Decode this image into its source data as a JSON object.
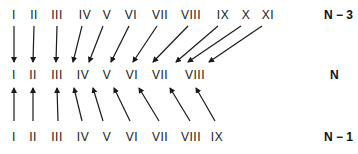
{
  "diagram": {
    "rows": {
      "top": {
        "label": "N − 3",
        "items": [
          "I",
          "II",
          "III",
          "IV",
          "V",
          "VI",
          "VII",
          "VIII",
          "IX",
          "X",
          "XI"
        ],
        "x": [
          14,
          34,
          57,
          85,
          107,
          131,
          160,
          191,
          223,
          246,
          268
        ],
        "y": 19
      },
      "middle": {
        "label": "N",
        "items": [
          "I",
          "II",
          "III",
          "IV",
          "V",
          "VI",
          "VII",
          "VIII"
        ],
        "x": [
          14,
          33,
          57,
          83,
          107,
          132,
          160,
          195
        ],
        "y": 79
      },
      "bottom": {
        "label": "N − 1",
        "items": [
          "I",
          "II",
          "III",
          "IV",
          "V",
          "VI",
          "VII",
          "VIII",
          "IX"
        ],
        "x": [
          14,
          33,
          57,
          83,
          107,
          132,
          160,
          191,
          217
        ],
        "y": 141
      }
    },
    "arrows_top_to_middle": [
      {
        "from": "I",
        "to": "I"
      },
      {
        "from": "II",
        "to": "II"
      },
      {
        "from": "III",
        "to": "III"
      },
      {
        "from": "IV",
        "to": "IV"
      },
      {
        "from": "V",
        "to": "V"
      },
      {
        "from": "VI",
        "to": "VI"
      },
      {
        "from": "VII",
        "to": "VII"
      },
      {
        "from": "VIII",
        "to": "VIII"
      },
      {
        "from": "IX",
        "to": "VIII"
      },
      {
        "from": "X",
        "to": "VIII"
      },
      {
        "from": "XI",
        "to": "VIII"
      }
    ],
    "arrows_bottom_to_middle": [
      {
        "from": "I",
        "to": "I"
      },
      {
        "from": "II",
        "to": "II"
      },
      {
        "from": "III",
        "to": "III"
      },
      {
        "from": "IV",
        "to": "IV"
      },
      {
        "from": "V",
        "to": "V"
      },
      {
        "from": "VI",
        "to": "VI"
      },
      {
        "from": "VII",
        "to": "VII"
      },
      {
        "from": "VIII",
        "to": "VIII"
      },
      {
        "from": "IX",
        "to": "VIII"
      }
    ],
    "arrow_color": "#1a1a1a"
  }
}
